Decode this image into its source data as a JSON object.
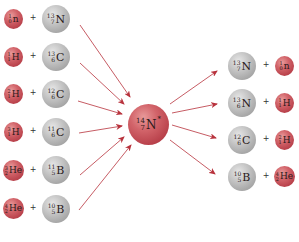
{
  "diagram": {
    "type": "nuclear-reaction-compound-nucleus",
    "colors": {
      "light_particle": "#c9535b",
      "heavy_nucleus": "#b0b0b0",
      "compound_nucleus": "#c9535b",
      "arrow": "#b8323c"
    },
    "compound_nucleus": {
      "mass": "14",
      "atomic": "7",
      "symbol": "N",
      "excited": "*"
    },
    "plus_sign": "+",
    "reactants": [
      {
        "particle": {
          "mass": "1",
          "atomic": "0",
          "symbol": "n"
        },
        "target": {
          "mass": "13",
          "atomic": "7",
          "symbol": "N"
        }
      },
      {
        "particle": {
          "mass": "1",
          "atomic": "1",
          "symbol": "H"
        },
        "target": {
          "mass": "13",
          "atomic": "6",
          "symbol": "C"
        }
      },
      {
        "particle": {
          "mass": "2",
          "atomic": "1",
          "symbol": "H"
        },
        "target": {
          "mass": "12",
          "atomic": "6",
          "symbol": "C"
        }
      },
      {
        "particle": {
          "mass": "3",
          "atomic": "1",
          "symbol": "H"
        },
        "target": {
          "mass": "11",
          "atomic": "6",
          "symbol": "C"
        }
      },
      {
        "particle": {
          "mass": "3",
          "atomic": "2",
          "symbol": "He"
        },
        "target": {
          "mass": "11",
          "atomic": "5",
          "symbol": "B"
        }
      },
      {
        "particle": {
          "mass": "4",
          "atomic": "2",
          "symbol": "He"
        },
        "target": {
          "mass": "10",
          "atomic": "5",
          "symbol": "B"
        }
      }
    ],
    "products": [
      {
        "residual": {
          "mass": "13",
          "atomic": "7",
          "symbol": "N"
        },
        "particle": {
          "mass": "1",
          "atomic": "0",
          "symbol": "n"
        }
      },
      {
        "residual": {
          "mass": "13",
          "atomic": "6",
          "symbol": "N"
        },
        "particle": {
          "mass": "1",
          "atomic": "1",
          "symbol": "H"
        }
      },
      {
        "residual": {
          "mass": "12",
          "atomic": "6",
          "symbol": "C"
        },
        "particle": {
          "mass": "2",
          "atomic": "1",
          "symbol": "H"
        }
      },
      {
        "residual": {
          "mass": "10",
          "atomic": "5",
          "symbol": "B"
        },
        "particle": {
          "mass": "4",
          "atomic": "2",
          "symbol": "He"
        }
      }
    ]
  }
}
